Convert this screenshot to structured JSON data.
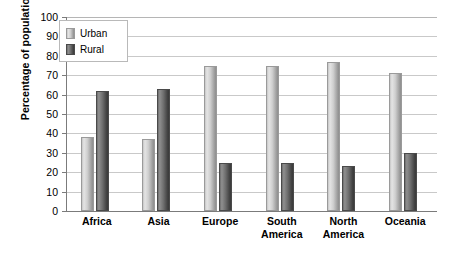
{
  "chart_data": {
    "type": "bar",
    "title": "",
    "xlabel": "",
    "ylabel": "Percentage of population",
    "ylim": [
      0,
      100
    ],
    "ytick_step": 10,
    "yticks": [
      100,
      90,
      80,
      70,
      60,
      50,
      40,
      30,
      20,
      10,
      0
    ],
    "grid": true,
    "legend_position": "top-left-inside",
    "categories": [
      "Africa",
      "Asia",
      "Europe",
      "South America",
      "North America",
      "Oceania"
    ],
    "series": [
      {
        "name": "Urban",
        "color": "#cfcfcf",
        "values": [
          38,
          37,
          75,
          75,
          77,
          71
        ]
      },
      {
        "name": "Rural",
        "color": "#595959",
        "values": [
          62,
          63,
          25,
          25,
          23,
          30
        ]
      }
    ]
  },
  "axis": {
    "ylabel": "Percentage of population",
    "yticks": [
      "100",
      "90",
      "80",
      "70",
      "60",
      "50",
      "40",
      "30",
      "20",
      "10",
      "0"
    ],
    "xlabels": [
      {
        "line1": "Africa",
        "line2": ""
      },
      {
        "line1": "Asia",
        "line2": ""
      },
      {
        "line1": "Europe",
        "line2": ""
      },
      {
        "line1": "South",
        "line2": "America"
      },
      {
        "line1": "North",
        "line2": "America"
      },
      {
        "line1": "Oceania",
        "line2": ""
      }
    ]
  },
  "legend": {
    "items": [
      {
        "label": "Urban"
      },
      {
        "label": "Rural"
      }
    ]
  }
}
